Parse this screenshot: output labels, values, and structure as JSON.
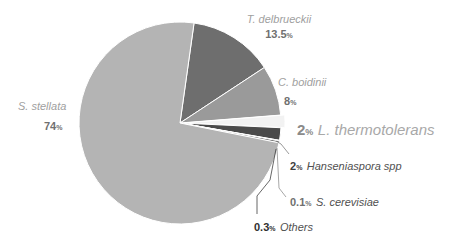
{
  "chart_data": {
    "type": "pie",
    "title": "",
    "start_angle_deg": 8,
    "center": [
      180,
      123
    ],
    "radius": 101,
    "slices": [
      {
        "label": "T. delbrueckii",
        "value": 13.5,
        "color": "#6e6e6e"
      },
      {
        "label": "C. boidinii",
        "value": 8,
        "color": "#9a9a9a"
      },
      {
        "label": "L. thermotolerans",
        "value": 2,
        "color": "#f2f2f2",
        "exploded": true
      },
      {
        "label": "Hanseniaspora spp",
        "value": 2,
        "color": "#4a4a4a"
      },
      {
        "label": "S. cerevisiae",
        "value": 0.1,
        "color": "#e0e0e0"
      },
      {
        "label": "Others",
        "value": 0.3,
        "color": "#5a5a5a"
      },
      {
        "label": "S. stellata",
        "value": 74,
        "color": "#b4b4b4"
      }
    ],
    "labels": [
      {
        "name": "T. delbrueckii",
        "pct": "13.5",
        "unit": "%"
      },
      {
        "name": "C. boidinii",
        "pct": "8",
        "unit": "%"
      },
      {
        "name": "L. thermotolerans",
        "pct": "2",
        "unit": "%"
      },
      {
        "name": "Hanseniaspora spp",
        "pct": "2",
        "unit": "%"
      },
      {
        "name": "S. cerevisiae",
        "pct": "0.1",
        "unit": "%"
      },
      {
        "name": "Others",
        "pct": "0.3",
        "unit": "%"
      },
      {
        "name": "S. stellata",
        "pct": "74",
        "unit": "%"
      }
    ],
    "legend": "none (direct labels)"
  }
}
